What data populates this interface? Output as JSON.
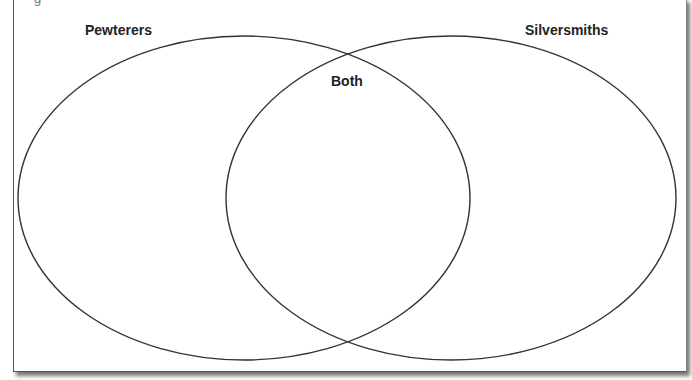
{
  "diagram": {
    "type": "venn",
    "top_fragment": "g",
    "sets": [
      {
        "id": "left",
        "label": "Pewterers"
      },
      {
        "id": "right",
        "label": "Silversmiths"
      }
    ],
    "intersection": {
      "label": "Both"
    },
    "colors": {
      "stroke": "#333333",
      "background": "#ffffff",
      "label": "#222222"
    }
  }
}
